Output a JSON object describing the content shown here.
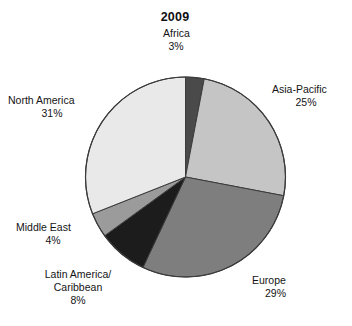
{
  "chart_data": {
    "type": "pie",
    "title": "2009",
    "xlabel": "",
    "ylabel": "",
    "legend_position": "none",
    "labels_outside": true,
    "categories": [
      "Africa",
      "Asia-Pacific",
      "Europe",
      "Latin America/Caribbean",
      "Middle East",
      "North America"
    ],
    "values": [
      3,
      25,
      29,
      8,
      4,
      31
    ],
    "value_unit": "%",
    "start_angle_deg": 0,
    "direction": "clockwise",
    "slices": [
      {
        "label": "Africa",
        "label_line1": "Africa",
        "label_line2": "",
        "percent_text": "3%",
        "value": 3,
        "color": "#4a4a4a"
      },
      {
        "label": "Asia-Pacific",
        "label_line1": "Asia-Pacific",
        "label_line2": "",
        "percent_text": "25%",
        "value": 25,
        "color": "#c5c5c5"
      },
      {
        "label": "Europe",
        "label_line1": "Europe",
        "label_line2": "",
        "percent_text": "29%",
        "value": 29,
        "color": "#7e7e7e"
      },
      {
        "label": "Latin America/Caribbean",
        "label_line1": "Latin America/",
        "label_line2": "Caribbean",
        "percent_text": "8%",
        "value": 8,
        "color": "#1c1c1c"
      },
      {
        "label": "Middle East",
        "label_line1": "Middle East",
        "label_line2": "",
        "percent_text": "4%",
        "value": 4,
        "color": "#9b9b9b"
      },
      {
        "label": "North America",
        "label_line1": "North America",
        "label_line2": "",
        "percent_text": "31%",
        "value": 31,
        "color": "#e9e9e9"
      }
    ],
    "outline_color": "#3b3b3b",
    "background_color": "#ffffff"
  }
}
